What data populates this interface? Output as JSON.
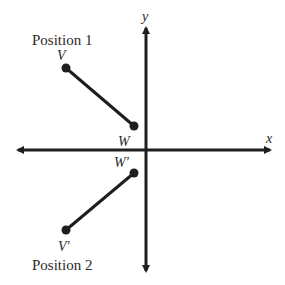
{
  "diagram": {
    "axes": {
      "x_label": "x",
      "y_label": "y"
    },
    "position1": {
      "title": "Position 1",
      "point_v": "V",
      "point_w": "W"
    },
    "position2": {
      "title": "Position 2",
      "point_v": "V'",
      "point_w": "W'"
    },
    "colors": {
      "stroke": "#1e1e1e",
      "text": "#2a2a2a"
    }
  }
}
